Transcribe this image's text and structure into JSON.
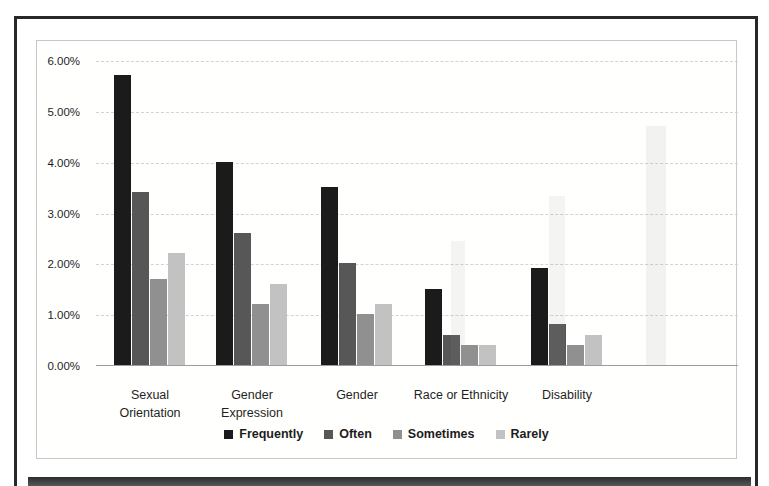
{
  "page": {
    "kind": "scanned-figure"
  },
  "chart_data": {
    "type": "bar",
    "title": "",
    "xlabel": "",
    "ylabel": "",
    "categories": [
      "Sexual Orientation",
      "Gender Expression",
      "Gender",
      "Race or Ethnicity",
      "Disability"
    ],
    "category_lines": [
      [
        "Sexual",
        "Orientation"
      ],
      [
        "Gender",
        "Expression"
      ],
      [
        "Gender"
      ],
      [
        "Race or Ethnicity"
      ],
      [
        "Disability"
      ]
    ],
    "series": [
      {
        "name": "Frequently",
        "color": "#1b1b1b",
        "values": [
          5.7,
          4.0,
          3.5,
          1.5,
          1.9
        ]
      },
      {
        "name": "Often",
        "color": "#575757",
        "values": [
          3.4,
          2.6,
          2.0,
          0.6,
          0.8
        ]
      },
      {
        "name": "Sometimes",
        "color": "#909090",
        "values": [
          1.7,
          1.2,
          1.0,
          0.4,
          0.4
        ]
      },
      {
        "name": "Rarely",
        "color": "#c2c2c2",
        "values": [
          2.2,
          1.6,
          1.2,
          0.4,
          0.6
        ]
      }
    ],
    "value_unit": "%",
    "ylim": [
      0,
      6
    ],
    "yticks": [
      {
        "value": 0,
        "label": "0.00%"
      },
      {
        "value": 1,
        "label": "1.00%"
      },
      {
        "value": 2,
        "label": "2.00%"
      },
      {
        "value": 3,
        "label": "3.00%"
      },
      {
        "value": 4,
        "label": "4.00%"
      },
      {
        "value": 5,
        "label": "5.00%"
      },
      {
        "value": 6,
        "label": "6.00%"
      }
    ],
    "grid": true,
    "legend_position": "bottom",
    "legend": [
      "Frequently",
      "Often",
      "Sometimes",
      "Rarely"
    ]
  }
}
